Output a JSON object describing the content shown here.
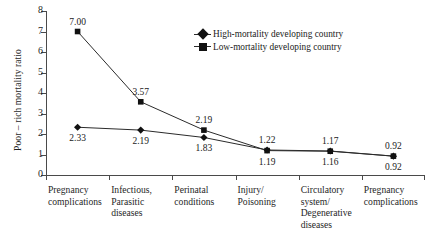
{
  "chart_data": {
    "type": "line",
    "title": "",
    "subtitle": "",
    "xlabel": "",
    "ylabel": "Poor – rich mortality ratio",
    "ylim": [
      0,
      8
    ],
    "ytick_labels": [
      "0",
      "1",
      "2",
      "3",
      "4",
      "5",
      "6",
      "7",
      "8"
    ],
    "ytick_values": [
      0,
      1,
      2,
      3,
      4,
      5,
      6,
      7,
      8
    ],
    "grid": false,
    "legend_position": "upper-center",
    "categories": [
      "Pregnancy complications",
      "Infectious, Parasitic diseases",
      "Perinatal conditions",
      "Injury/ Poisoning",
      "Circulatory system/ Degenerative diseases",
      "Pregnancy complications"
    ],
    "category_lines": [
      [
        "Pregnancy",
        "complications"
      ],
      [
        "Infectious,",
        "Parasitic",
        "diseases"
      ],
      [
        "Perinatal",
        "conditions"
      ],
      [
        "Injury/",
        "Poisoning"
      ],
      [
        "Circulatory",
        "system/",
        "Degenerative",
        "diseases"
      ],
      [
        "Pregnancy",
        "complications"
      ]
    ],
    "series": [
      {
        "name": "High-mortality developing country",
        "marker": "diamond",
        "values": [
          2.33,
          2.19,
          1.83,
          1.22,
          1.17,
          0.92
        ],
        "labels": [
          "2.33",
          "2.19",
          "1.83",
          "1.22",
          "1.17",
          "0.92"
        ],
        "label_positions": [
          "below",
          "below",
          "below",
          "above",
          "above",
          "above"
        ]
      },
      {
        "name": "Low-mortality developing country",
        "marker": "square",
        "values": [
          7.0,
          3.57,
          2.19,
          1.19,
          1.16,
          0.92
        ],
        "labels": [
          "7.00",
          "3.57",
          "2.19",
          "1.19",
          "1.16",
          "0.92"
        ],
        "label_positions": [
          "above",
          "above",
          "above",
          "below",
          "below",
          "below"
        ]
      }
    ],
    "colors": {
      "line": "#2b2b2b",
      "marker": "#111111",
      "axis": "#4a4a4a",
      "text": "#1a1a1a",
      "background": "#ffffff"
    }
  },
  "legend": {
    "items": [
      {
        "label": "High-mortality developing country",
        "marker": "diamond"
      },
      {
        "label": "Low-mortality developing country",
        "marker": "square"
      }
    ]
  }
}
